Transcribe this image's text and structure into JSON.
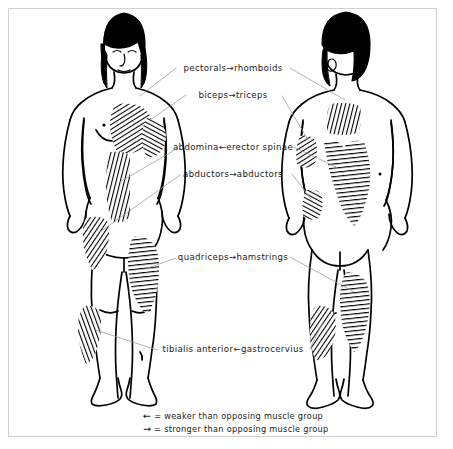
{
  "figure": {
    "views": [
      {
        "name": "anterior-female-figure",
        "side": "front"
      },
      {
        "name": "posterior-female-figure",
        "side": "back"
      }
    ],
    "ink_color": "#000000",
    "paper_color": "#ffffff",
    "leader_line_color": "#9a9a9a",
    "frame_color": "#d2d2d2"
  },
  "labels": [
    {
      "left": "pectorals",
      "arrow": "→",
      "right": "rhomboids",
      "x": 233,
      "y": 69,
      "anterior_muscle": "pectorals",
      "posterior_muscle": "rhomboids"
    },
    {
      "left": "biceps",
      "arrow": "→",
      "right": "triceps",
      "x": 233,
      "y": 96,
      "anterior_muscle": "biceps",
      "posterior_muscle": "triceps"
    },
    {
      "left": "abdomina",
      "arrow": "←",
      "right": "erector spinae",
      "x": 233,
      "y": 148,
      "anterior_muscle": "abdominals",
      "posterior_muscle": "erector spinae"
    },
    {
      "left": "abductors",
      "arrow": "→",
      "right": "abductors",
      "x": 233,
      "y": 175,
      "anterior_muscle": "abductors",
      "posterior_muscle": "abductors"
    },
    {
      "left": "quadriceps",
      "arrow": "→",
      "right": "hamstrings",
      "x": 233,
      "y": 258,
      "anterior_muscle": "quadriceps",
      "posterior_muscle": "hamstrings"
    },
    {
      "left": "tibialis anterior",
      "arrow": "←",
      "right": "gastrocervius",
      "x": 233,
      "y": 350,
      "anterior_muscle": "tibialis anterior",
      "posterior_muscle": "gastrocervius"
    }
  ],
  "legend": {
    "weaker": {
      "arrow": "←",
      "text": "= weaker than opposing muscle group"
    },
    "stronger": {
      "arrow": "→",
      "text": "= stronger than opposing muscle group"
    }
  }
}
